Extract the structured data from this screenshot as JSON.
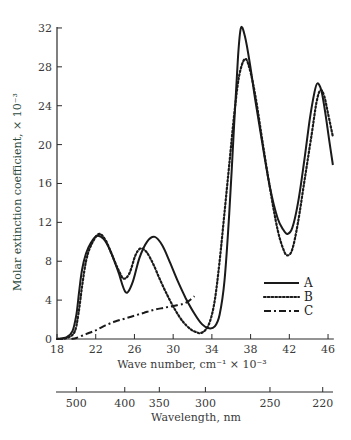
{
  "chart_data": {
    "type": "line",
    "title": "",
    "xlabel": "Wave number, cm⁻¹ × 10⁻³",
    "ylabel": "Molar extinction coefficient, × 10⁻³",
    "secondary_xlabel": "Wavelength, nm",
    "xlim": [
      18,
      46.5
    ],
    "ylim": [
      0,
      32
    ],
    "x_ticks": [
      18,
      22,
      26,
      30,
      34,
      38,
      42,
      46
    ],
    "y_ticks": [
      0,
      4,
      8,
      12,
      16,
      20,
      24,
      28,
      32
    ],
    "secondary_x_ticks": [
      {
        "label": "500",
        "wavenumber": 20.0
      },
      {
        "label": "400",
        "wavenumber": 25.0
      },
      {
        "label": "350",
        "wavenumber": 28.57
      },
      {
        "label": "300",
        "wavenumber": 33.33
      },
      {
        "label": "250",
        "wavenumber": 40.0
      },
      {
        "label": "220",
        "wavenumber": 45.45
      }
    ],
    "grid": false,
    "legend_position": "lower right",
    "series": [
      {
        "name": "A",
        "style": "solid",
        "x": [
          18,
          19,
          19.6,
          20,
          20.3,
          20.6,
          21,
          21.5,
          22.1,
          22.8,
          23.5,
          24.3,
          25.1,
          25.8,
          26.5,
          27.3,
          28.1,
          28.9,
          29.7,
          30.5,
          31.3,
          32.2,
          33,
          33.7,
          34.3,
          34.8,
          35.3,
          35.8,
          36.3,
          36.7,
          37.0,
          37.4,
          37.9,
          38.5,
          39.2,
          40,
          40.8,
          41.4,
          41.8,
          42.3,
          42.9,
          43.5,
          44.1,
          44.6,
          44.9,
          45.3,
          45.7,
          46.1,
          46.5
        ],
        "y": [
          0,
          0.2,
          0.8,
          2.5,
          5.0,
          7.2,
          8.8,
          9.9,
          10.6,
          10.3,
          9.1,
          7.0,
          4.8,
          5.8,
          8.3,
          10.0,
          10.5,
          9.6,
          7.8,
          5.9,
          4.2,
          2.6,
          1.5,
          1.1,
          1.3,
          2.5,
          6,
          13,
          22,
          29,
          32,
          31.2,
          28.5,
          24.5,
          20.2,
          15.6,
          12.4,
          11.2,
          10.8,
          11.4,
          14,
          18,
          22.5,
          25.4,
          26.3,
          25.6,
          23.4,
          20.6,
          17.9
        ]
      },
      {
        "name": "B",
        "style": "dotted",
        "x": [
          18,
          19,
          19.8,
          20.2,
          20.6,
          21,
          21.5,
          22.3,
          23,
          23.7,
          24.4,
          24.9,
          25.5,
          26.1,
          26.6,
          27.2,
          27.9,
          28.6,
          29.4,
          30.2,
          31,
          31.8,
          32.4,
          32.8,
          33.3,
          33.8,
          34.3,
          34.8,
          35.3,
          35.8,
          36.3,
          36.8,
          37.4,
          37.9,
          38.5,
          39.2,
          40,
          40.8,
          41.4,
          41.8,
          42.3,
          42.9,
          43.6,
          44.3,
          44.8,
          45.2,
          45.6,
          46.0,
          46.5
        ],
        "y": [
          0,
          0.1,
          0.7,
          2.5,
          5.5,
          8.0,
          9.6,
          10.8,
          10.2,
          8.6,
          7.0,
          6.2,
          6.8,
          8.6,
          9.3,
          9.0,
          7.8,
          6.2,
          4.5,
          3.0,
          1.8,
          1.0,
          0.7,
          0.6,
          0.9,
          1.8,
          4.0,
          8.0,
          13,
          18,
          23,
          27,
          28.8,
          27.8,
          25,
          20.5,
          15.5,
          11.2,
          9.2,
          8.6,
          9.2,
          12,
          16.5,
          21,
          24.3,
          25.6,
          25.0,
          23.2,
          20.8
        ]
      },
      {
        "name": "C",
        "style": "dash-dot",
        "x": [
          19.5,
          20,
          21,
          22,
          23,
          24,
          25,
          26,
          27,
          28,
          29,
          30,
          31,
          31.6,
          32.2
        ],
        "y": [
          0,
          0.1,
          0.5,
          0.9,
          1.4,
          1.8,
          2.1,
          2.4,
          2.7,
          3.0,
          3.2,
          3.4,
          3.6,
          3.9,
          4.4
        ]
      }
    ]
  },
  "plot": {
    "px_x0": 57,
    "px_per_x": 9.68,
    "px_y0": 339,
    "px_per_y": 9.72
  },
  "legend": [
    {
      "label": "A",
      "style": "solid"
    },
    {
      "label": "B",
      "style": "dotted"
    },
    {
      "label": "C",
      "style": "dash-dot"
    }
  ]
}
